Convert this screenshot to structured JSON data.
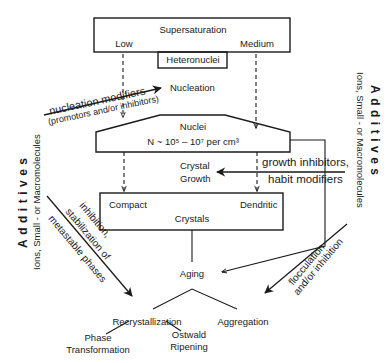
{
  "diagram": {
    "supersaturation": {
      "title": "Supersaturation",
      "low": "Low",
      "medium": "Medium"
    },
    "heteronuclei": "Heteronuclei",
    "nucleation": "Nucleation",
    "nucleation_modifiers": {
      "line1": "nucleation modifiers",
      "line2": "(promotors and/or inhibitors)"
    },
    "nuclei": {
      "title": "Nuclei",
      "density": "N ~ 10⁵ – 10⁷ per cm³"
    },
    "crystal_growth": {
      "line1": "Crystal",
      "line2": "Growth"
    },
    "growth_modifiers": {
      "line1": "growth inhibitors,",
      "line2": "habit modifiers"
    },
    "crystals": {
      "title": "Crystals",
      "compact": "Compact",
      "dendritic": "Dendritic"
    },
    "aging": "Aging",
    "inhibition": {
      "line1": "inhibition,",
      "line2": "stabilization of",
      "line3": "metastable phases"
    },
    "flocculation": {
      "line1": "flocculation",
      "line2": "and/or inhibition"
    },
    "recrystallization": "Recrystallization",
    "aggregation": "Aggregation",
    "phase_transformation": {
      "line1": "Phase",
      "line2": "Transformation"
    },
    "ostwald_ripening": {
      "line1": "Ostwald",
      "line2": "Ripening"
    },
    "additives_left": {
      "title": "Additives",
      "subtitle": "Ions, Small - or Macromolecules"
    },
    "additives_right": {
      "title": "Additives",
      "subtitle": "Ions, Small - or Macromolecules"
    }
  }
}
